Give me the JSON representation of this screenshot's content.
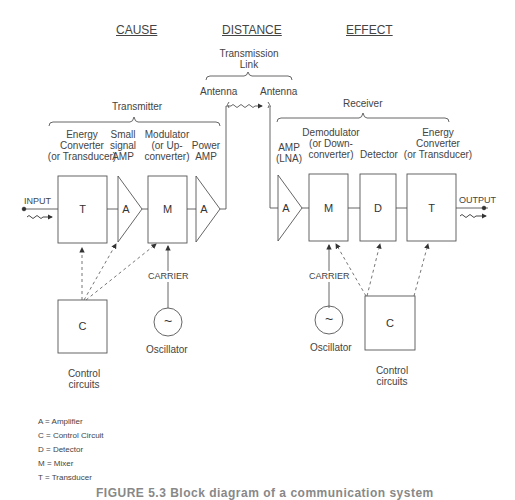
{
  "headers": {
    "cause": "CAUSE",
    "distance": "DISTANCE",
    "effect": "EFFECT"
  },
  "transmission_link": {
    "label_line1": "Transmission",
    "label_line2": "Link",
    "antenna_left": "Antenna",
    "antenna_right": "Antenna"
  },
  "transmitter": {
    "group_label": "Transmitter",
    "stages": [
      {
        "caption": [
          "Energy",
          "Converter",
          "(or Transducer)"
        ],
        "symbol": "T"
      },
      {
        "caption": [
          "Small",
          "signal",
          "AMP"
        ],
        "symbol": "A"
      },
      {
        "caption": [
          "Modulator",
          "(or Up-",
          "converter)"
        ],
        "symbol": "M"
      },
      {
        "caption": [
          "Power",
          "AMP"
        ],
        "symbol": "A"
      }
    ],
    "input_label": "INPUT",
    "carrier_label": "CARRIER",
    "oscillator_label": "Oscillator",
    "oscillator_symbol": "~",
    "control": {
      "symbol": "C",
      "caption": [
        "Control",
        "circuits"
      ]
    }
  },
  "receiver": {
    "group_label": "Receiver",
    "stages": [
      {
        "caption": [
          "AMP",
          "(LNA)"
        ],
        "symbol": "A"
      },
      {
        "caption": [
          "Demodulator",
          "(or Down-",
          "converter)"
        ],
        "symbol": "M"
      },
      {
        "caption": [
          "Detector"
        ],
        "symbol": "D"
      },
      {
        "caption": [
          "Energy",
          "Converter",
          "(or Transducer)"
        ],
        "symbol": "T"
      }
    ],
    "output_label": "OUTPUT",
    "carrier_label": "CARRIER",
    "oscillator_label": "Oscillator",
    "oscillator_symbol": "~",
    "control": {
      "symbol": "C",
      "caption": [
        "Control",
        "circuits"
      ]
    }
  },
  "legend": [
    "A = Amplifier",
    "C = Control Circuit",
    "D = Detector",
    "M = Mixer",
    "T = Transducer"
  ],
  "caption": "FIGURE 5.3   Block diagram of a communication system"
}
